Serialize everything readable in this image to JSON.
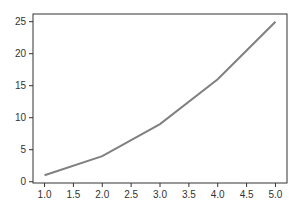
{
  "chart_data": {
    "type": "line",
    "title": "",
    "xlabel": "",
    "ylabel": "",
    "x": [
      1.0,
      2.0,
      3.0,
      4.0,
      5.0
    ],
    "series": [
      {
        "name": "y",
        "values": [
          1,
          4,
          9,
          16,
          25
        ],
        "color": "#808080"
      }
    ],
    "xticks": [
      "1.0",
      "1.5",
      "2.0",
      "2.5",
      "3.0",
      "3.5",
      "4.0",
      "4.5",
      "5.0"
    ],
    "yticks": [
      "0",
      "5",
      "10",
      "15",
      "20",
      "25"
    ],
    "xlim": [
      0.8,
      5.2
    ],
    "ylim": [
      -0.2,
      26.2
    ],
    "grid": false,
    "legend": null
  }
}
